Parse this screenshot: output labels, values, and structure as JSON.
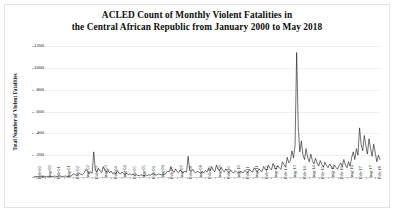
{
  "figure": {
    "title_line1": "ACLED Count of Monthly Violent Fatalities in",
    "title_line2": "the Central African Republic from January 2000 to May 2018",
    "background_color": "#ffffff",
    "border_color": "#e2e2e2",
    "line_color": "#111111"
  },
  "chart_data": {
    "type": "line",
    "title": "ACLED Count of Monthly Violent Fatalities in the Central African Republic from January 2000 to May 2018",
    "xlabel": "",
    "ylabel": "Total Number of Violent Fatalities",
    "ylim": [
      0,
      1200
    ],
    "yticks": [
      0,
      200,
      400,
      600,
      800,
      1000,
      1200
    ],
    "ytick_labels": [
      "0",
      "200",
      "400",
      "600",
      "800",
      "1000",
      "1200"
    ],
    "grid": true,
    "legend": "none",
    "x_tick_interval_months": 6,
    "x_start": "Jan-00",
    "x_end": "May-18",
    "xtick_labels": [
      "Feb-00",
      "Aug-00",
      "Feb-01",
      "Aug-01",
      "Feb-02",
      "Aug-02",
      "Feb-03",
      "Aug-03",
      "Feb-04",
      "Aug-04",
      "Feb-05",
      "Aug-05",
      "Feb-06",
      "Aug-06",
      "Feb-07",
      "Aug-07",
      "Feb-08",
      "Aug-08",
      "Feb-09",
      "Aug-09",
      "Feb-10",
      "Aug-10",
      "Feb-11",
      "Aug-11",
      "Feb-12",
      "Aug-12",
      "Feb-13",
      "Aug-13",
      "Feb-14",
      "Aug-14",
      "Feb-15",
      "Aug-15",
      "Feb-16",
      "Aug-16",
      "Feb-17",
      "Aug-17",
      "Feb-18"
    ],
    "x": [
      "Jan-00",
      "Feb-00",
      "Mar-00",
      "Apr-00",
      "May-00",
      "Jun-00",
      "Jul-00",
      "Aug-00",
      "Sep-00",
      "Oct-00",
      "Nov-00",
      "Dec-00",
      "Jan-01",
      "Feb-01",
      "Mar-01",
      "Apr-01",
      "May-01",
      "Jun-01",
      "Jul-01",
      "Aug-01",
      "Sep-01",
      "Oct-01",
      "Nov-01",
      "Dec-01",
      "Jan-02",
      "Feb-02",
      "Mar-02",
      "Apr-02",
      "May-02",
      "Jun-02",
      "Jul-02",
      "Aug-02",
      "Sep-02",
      "Oct-02",
      "Nov-02",
      "Dec-02",
      "Jan-03",
      "Feb-03",
      "Mar-03",
      "Apr-03",
      "May-03",
      "Jun-03",
      "Jul-03",
      "Aug-03",
      "Sep-03",
      "Oct-03",
      "Nov-03",
      "Dec-03",
      "Jan-04",
      "Feb-04",
      "Mar-04",
      "Apr-04",
      "May-04",
      "Jun-04",
      "Jul-04",
      "Aug-04",
      "Sep-04",
      "Oct-04",
      "Nov-04",
      "Dec-04",
      "Jan-05",
      "Feb-05",
      "Mar-05",
      "Apr-05",
      "May-05",
      "Jun-05",
      "Jul-05",
      "Aug-05",
      "Sep-05",
      "Oct-05",
      "Nov-05",
      "Dec-05",
      "Jan-06",
      "Feb-06",
      "Mar-06",
      "Apr-06",
      "May-06",
      "Jun-06",
      "Jul-06",
      "Aug-06",
      "Sep-06",
      "Oct-06",
      "Nov-06",
      "Dec-06",
      "Jan-07",
      "Feb-07",
      "Mar-07",
      "Apr-07",
      "May-07",
      "Jun-07",
      "Jul-07",
      "Aug-07",
      "Sep-07",
      "Oct-07",
      "Nov-07",
      "Dec-07",
      "Jan-08",
      "Feb-08",
      "Mar-08",
      "Apr-08",
      "May-08",
      "Jun-08",
      "Jul-08",
      "Aug-08",
      "Sep-08",
      "Oct-08",
      "Nov-08",
      "Dec-08",
      "Jan-09",
      "Feb-09",
      "Mar-09",
      "Apr-09",
      "May-09",
      "Jun-09",
      "Jul-09",
      "Aug-09",
      "Sep-09",
      "Oct-09",
      "Nov-09",
      "Dec-09",
      "Jan-10",
      "Feb-10",
      "Mar-10",
      "Apr-10",
      "May-10",
      "Jun-10",
      "Jul-10",
      "Aug-10",
      "Sep-10",
      "Oct-10",
      "Nov-10",
      "Dec-10",
      "Jan-11",
      "Feb-11",
      "Mar-11",
      "Apr-11",
      "May-11",
      "Jun-11",
      "Jul-11",
      "Aug-11",
      "Sep-11",
      "Oct-11",
      "Nov-11",
      "Dec-11",
      "Jan-12",
      "Feb-12",
      "Mar-12",
      "Apr-12",
      "May-12",
      "Jun-12",
      "Jul-12",
      "Aug-12",
      "Sep-12",
      "Oct-12",
      "Nov-12",
      "Dec-12",
      "Jan-13",
      "Feb-13",
      "Mar-13",
      "Apr-13",
      "May-13",
      "Jun-13",
      "Jul-13",
      "Aug-13",
      "Sep-13",
      "Oct-13",
      "Nov-13",
      "Dec-13",
      "Jan-14",
      "Feb-14",
      "Mar-14",
      "Apr-14",
      "May-14",
      "Jun-14",
      "Jul-14",
      "Aug-14",
      "Sep-14",
      "Oct-14",
      "Nov-14",
      "Dec-14",
      "Jan-15",
      "Feb-15",
      "Mar-15",
      "Apr-15",
      "May-15",
      "Jun-15",
      "Jul-15",
      "Aug-15",
      "Sep-15",
      "Oct-15",
      "Nov-15",
      "Dec-15",
      "Jan-16",
      "Feb-16",
      "Mar-16",
      "Apr-16",
      "May-16",
      "Jun-16",
      "Jul-16",
      "Aug-16",
      "Sep-16",
      "Oct-16",
      "Nov-16",
      "Dec-16",
      "Jan-17",
      "Feb-17",
      "Mar-17",
      "Apr-17",
      "May-17",
      "Jun-17",
      "Jul-17",
      "Aug-17",
      "Sep-17",
      "Oct-17",
      "Nov-17",
      "Dec-17",
      "Jan-18",
      "Feb-18",
      "Mar-18",
      "Apr-18",
      "May-18"
    ],
    "values": [
      2,
      4,
      3,
      6,
      2,
      5,
      3,
      2,
      6,
      4,
      3,
      5,
      4,
      8,
      6,
      5,
      10,
      7,
      4,
      6,
      9,
      5,
      4,
      8,
      12,
      30,
      22,
      14,
      20,
      35,
      18,
      25,
      40,
      70,
      55,
      30,
      48,
      35,
      230,
      60,
      45,
      80,
      55,
      40,
      95,
      60,
      45,
      70,
      38,
      55,
      30,
      42,
      25,
      60,
      35,
      28,
      45,
      30,
      22,
      35,
      20,
      30,
      18,
      25,
      14,
      22,
      16,
      12,
      20,
      15,
      12,
      18,
      14,
      20,
      16,
      25,
      30,
      22,
      18,
      28,
      24,
      20,
      26,
      22,
      35,
      55,
      48,
      90,
      60,
      42,
      75,
      50,
      38,
      65,
      45,
      40,
      55,
      45,
      190,
      60,
      50,
      70,
      45,
      38,
      55,
      42,
      35,
      48,
      40,
      60,
      45,
      80,
      55,
      95,
      62,
      48,
      110,
      70,
      55,
      90,
      60,
      48,
      75,
      52,
      40,
      65,
      45,
      38,
      58,
      42,
      35,
      50,
      45,
      38,
      62,
      48,
      40,
      70,
      52,
      45,
      85,
      60,
      48,
      75,
      58,
      50,
      95,
      70,
      60,
      110,
      80,
      65,
      125,
      90,
      70,
      105,
      85,
      70,
      140,
      110,
      95,
      180,
      130,
      150,
      240,
      175,
      290,
      1140,
      460,
      230,
      330,
      200,
      160,
      260,
      180,
      140,
      210,
      150,
      120,
      170,
      130,
      100,
      150,
      115,
      90,
      135,
      105,
      85,
      120,
      95,
      75,
      110,
      88,
      70,
      105,
      130,
      95,
      160,
      110,
      85,
      140,
      100,
      180,
      230,
      160,
      260,
      200,
      450,
      300,
      240,
      380,
      290,
      210,
      350,
      260,
      190,
      300,
      220,
      140,
      200,
      160
    ]
  }
}
